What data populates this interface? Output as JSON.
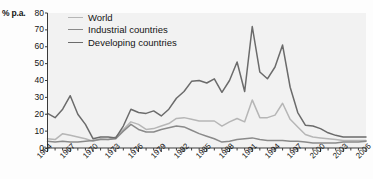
{
  "chart_data": {
    "type": "line",
    "title": "",
    "subtitle": "",
    "xlabel": "",
    "ylabel": "% p.a.",
    "ylim": [
      0,
      80
    ],
    "yticks": [
      0,
      10,
      20,
      30,
      40,
      50,
      60,
      70,
      80
    ],
    "xlim": [
      1964,
      2006
    ],
    "xticks": [
      1964,
      1967,
      1970,
      1973,
      1976,
      1979,
      1982,
      1985,
      1988,
      1991,
      1994,
      1997,
      2000,
      2003,
      2006
    ],
    "minor_xticks_every": 1,
    "grid": false,
    "legend_position": "top-left",
    "x": [
      1964,
      1965,
      1966,
      1967,
      1968,
      1969,
      1970,
      1971,
      1972,
      1973,
      1974,
      1975,
      1976,
      1977,
      1978,
      1979,
      1980,
      1981,
      1982,
      1983,
      1984,
      1985,
      1986,
      1987,
      1988,
      1989,
      1990,
      1991,
      1992,
      1993,
      1994,
      1995,
      1996,
      1997,
      1998,
      1999,
      2000,
      2001,
      2002,
      2003,
      2004,
      2005,
      2006
    ],
    "series": [
      {
        "name": "World",
        "color": "#b6b6b6",
        "values": [
          5.5,
          5.0,
          8.5,
          7.5,
          6.5,
          5.5,
          4.0,
          5.5,
          5.0,
          6.5,
          11.0,
          15.5,
          14.0,
          11.0,
          11.5,
          13.0,
          14.5,
          17.5,
          18.0,
          17.0,
          16.0,
          16.0,
          16.0,
          13.0,
          15.5,
          17.5,
          15.5,
          28.5,
          18.0,
          18.0,
          19.5,
          26.5,
          17.0,
          12.5,
          8.0,
          6.5,
          6.0,
          5.5,
          5.0,
          4.5,
          4.5,
          4.5,
          4.5
        ]
      },
      {
        "name": "Industrial countries",
        "color": "#8a8a8a",
        "values": [
          4.0,
          3.5,
          4.0,
          3.5,
          3.5,
          4.0,
          4.5,
          5.0,
          5.0,
          5.5,
          10.0,
          14.0,
          11.0,
          9.5,
          9.5,
          11.0,
          12.0,
          13.0,
          12.5,
          10.5,
          8.5,
          7.0,
          5.5,
          3.5,
          4.0,
          5.0,
          5.5,
          6.0,
          5.0,
          4.5,
          4.5,
          4.5,
          4.0,
          4.0,
          3.5,
          3.0,
          3.0,
          3.0,
          3.0,
          3.5,
          3.5,
          3.5,
          4.0
        ]
      },
      {
        "name": "Developing countries",
        "color": "#6b6b6b",
        "values": [
          20.5,
          18.0,
          23.0,
          31.0,
          20.0,
          14.0,
          5.5,
          6.5,
          6.5,
          6.0,
          13.0,
          23.0,
          21.0,
          20.5,
          22.0,
          19.0,
          23.0,
          29.5,
          33.5,
          39.5,
          40.0,
          38.5,
          41.0,
          33.0,
          40.0,
          51.0,
          33.5,
          72.0,
          45.0,
          41.0,
          48.0,
          61.0,
          36.0,
          21.0,
          13.5,
          13.0,
          11.5,
          9.0,
          7.5,
          6.5,
          6.5,
          6.5,
          6.5
        ]
      }
    ]
  },
  "axis": {
    "unit_label": "% p.a.",
    "y_tick_labels": [
      "80",
      "70",
      "60",
      "50",
      "40",
      "30",
      "20",
      "10",
      "0"
    ],
    "x_tick_labels": [
      "1964",
      "1967",
      "1970",
      "1973",
      "1976",
      "1979",
      "1982",
      "1985",
      "1988",
      "1991",
      "1994",
      "1997",
      "2000",
      "2003",
      "2006"
    ]
  },
  "legend": {
    "items": [
      {
        "label": "World",
        "color": "#b6b6b6"
      },
      {
        "label": "Industrial countries",
        "color": "#8a8a8a"
      },
      {
        "label": "Developing countries",
        "color": "#6b6b6b"
      }
    ]
  },
  "colors": {
    "plot_background": "#f2f2f2",
    "axis": "#3a3a3a",
    "text": "#141414"
  }
}
